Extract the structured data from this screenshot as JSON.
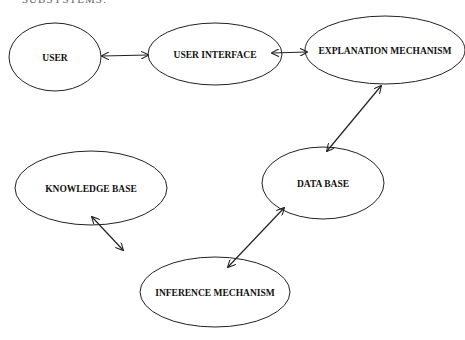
{
  "caption": "SUBSYSTEMS:",
  "colors": {
    "stroke": "#222222",
    "text": "#111111",
    "background": "#ffffff"
  },
  "nodes": [
    {
      "id": "user",
      "label": "USER",
      "cx": 55,
      "cy": 57,
      "rx": 46,
      "ry": 34
    },
    {
      "id": "user-interface",
      "label": "USER INTERFACE",
      "cx": 215,
      "cy": 54,
      "rx": 67,
      "ry": 31
    },
    {
      "id": "explanation-mechanism",
      "label": "EXPLANATION MECHANISM",
      "cx": 385,
      "cy": 50,
      "rx": 80,
      "ry": 34
    },
    {
      "id": "data-base",
      "label": "DATA BASE",
      "cx": 323,
      "cy": 183,
      "rx": 61,
      "ry": 36
    },
    {
      "id": "knowledge-base",
      "label": "KNOWLEDGE BASE",
      "cx": 91,
      "cy": 188,
      "rx": 76,
      "ry": 37
    },
    {
      "id": "inference-mechanism",
      "label": "INFERENCE MECHANISM",
      "cx": 215,
      "cy": 292,
      "rx": 75,
      "ry": 35
    }
  ],
  "edges": [
    {
      "from": "user",
      "to": "user-interface",
      "x1": 102,
      "y1": 56,
      "x2": 148,
      "y2": 55,
      "bidirectional": true
    },
    {
      "from": "user-interface",
      "to": "explanation-mechanism",
      "x1": 272,
      "y1": 53,
      "x2": 307,
      "y2": 52,
      "bidirectional": true
    },
    {
      "from": "explanation-mechanism",
      "to": "data-base",
      "x1": 381,
      "y1": 86,
      "x2": 327,
      "y2": 151,
      "bidirectional": true
    },
    {
      "from": "data-base",
      "to": "inference-mechanism",
      "x1": 284,
      "y1": 208,
      "x2": 228,
      "y2": 267,
      "bidirectional": true
    },
    {
      "from": "knowledge-base",
      "to": "inference-mechanism",
      "x1": 92,
      "y1": 217,
      "x2": 123,
      "y2": 250,
      "bidirectional": true
    }
  ]
}
